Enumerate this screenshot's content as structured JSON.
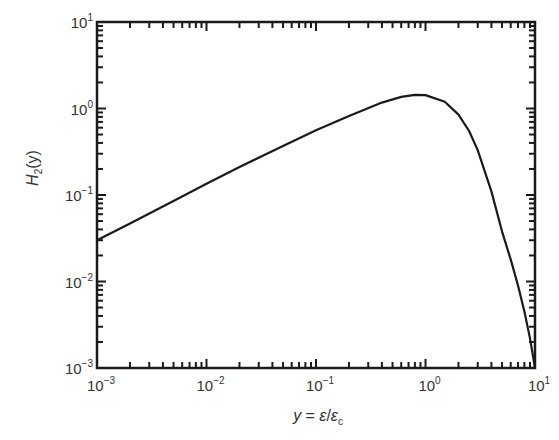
{
  "chart_data": {
    "type": "line",
    "title": "",
    "xlabel": "y = ε/ε_c",
    "ylabel": "H_2(y)",
    "xscale": "log",
    "yscale": "log",
    "xlim": [
      0.001,
      10
    ],
    "ylim": [
      0.001,
      10
    ],
    "grid": false,
    "legend": null,
    "x_ticks": [
      {
        "base": "10",
        "exp": "−3",
        "value": 0.001
      },
      {
        "base": "10",
        "exp": "−2",
        "value": 0.01
      },
      {
        "base": "10",
        "exp": "−1",
        "value": 0.1
      },
      {
        "base": "10",
        "exp": "0",
        "value": 1
      },
      {
        "base": "10",
        "exp": "1",
        "value": 10
      }
    ],
    "y_ticks": [
      {
        "base": "10",
        "exp": "−3",
        "value": 0.001
      },
      {
        "base": "10",
        "exp": "−2",
        "value": 0.01
      },
      {
        "base": "10",
        "exp": "−1",
        "value": 0.1
      },
      {
        "base": "10",
        "exp": "0",
        "value": 1
      },
      {
        "base": "10",
        "exp": "1",
        "value": 10
      }
    ],
    "series": [
      {
        "name": "H_2(y)",
        "color": "#1a1a1a",
        "x": [
          0.001,
          0.002,
          0.005,
          0.01,
          0.02,
          0.05,
          0.1,
          0.2,
          0.4,
          0.6,
          0.8,
          1.0,
          1.5,
          2.0,
          2.5,
          3.0,
          4.0,
          5.0,
          6.0,
          7.0,
          8.0,
          9.0,
          10.0
        ],
        "y": [
          0.03,
          0.047,
          0.085,
          0.135,
          0.21,
          0.37,
          0.56,
          0.82,
          1.17,
          1.36,
          1.44,
          1.43,
          1.2,
          0.85,
          0.55,
          0.33,
          0.11,
          0.038,
          0.018,
          0.009,
          0.0045,
          0.0022,
          0.001
        ]
      }
    ]
  },
  "axes": {
    "x_label": {
      "prefix": "y",
      "eq": " = ",
      "num": "ε",
      "slash": "/",
      "den": "ε",
      "den_sub": "c"
    },
    "y_label": {
      "main": "H",
      "sub": "2",
      "arg": "(y)"
    }
  }
}
